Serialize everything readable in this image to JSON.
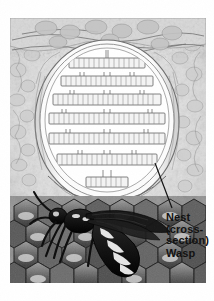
{
  "figure": {
    "style": "pencil / ink scientific illustration, grayscale halftone"
  },
  "labels": {
    "nest": {
      "name": "nest-label",
      "lines": [
        "Nest",
        "(cross-",
        "section)"
      ],
      "line1": "Nest",
      "line2": "(cross-",
      "line3": "section)",
      "x": 166,
      "y": 212,
      "leader_line": true
    },
    "wasp": {
      "name": "wasp-label",
      "lines": [
        "Wasp"
      ],
      "line1": "Wasp",
      "x": 166,
      "y": 248,
      "leader_line": false
    }
  },
  "leader_lines": [
    {
      "name": "nest-leader-line",
      "from_x": 155,
      "from_y": 163,
      "to_x": 172,
      "to_y": 208
    }
  ],
  "scene": {
    "background": {
      "name": "rock-wall-background",
      "description": "mottled rocky cavity wall surrounding the nest"
    },
    "ceiling": {
      "name": "nest-attachment-ceiling",
      "description": "rocky bark ceiling the nest hangs from"
    },
    "envelope": {
      "name": "nest-envelope",
      "description": "layered papery outer shell of the nest, shown cut open",
      "layers": 3
    },
    "combs": {
      "name": "comb-tiers",
      "description": "horizontal tiers of brood cells suspended by pedicels",
      "tier_count": 7,
      "tiers": [
        {
          "index": 1,
          "cy": 63,
          "half_width": 38,
          "cell_height": 9,
          "cells": 15
        },
        {
          "index": 2,
          "cy": 80,
          "half_width": 46,
          "cell_height": 9,
          "cells": 18
        },
        {
          "index": 3,
          "cy": 98,
          "half_width": 53,
          "cell_height": 10,
          "cells": 21
        },
        {
          "index": 4,
          "cy": 117,
          "half_width": 57,
          "cell_height": 10,
          "cells": 23
        },
        {
          "index": 5,
          "cy": 137,
          "half_width": 57,
          "cell_height": 10,
          "cells": 23
        },
        {
          "index": 6,
          "cy": 158,
          "half_width": 50,
          "cell_height": 10,
          "cells": 20
        },
        {
          "index": 7,
          "cy": 180,
          "half_width": 21,
          "cell_height": 9,
          "cells": 9
        }
      ]
    },
    "wasp": {
      "name": "wasp-illustration",
      "description": "adult wasp in profile standing on hexagonal comb",
      "parts": [
        "head",
        "antennae",
        "thorax",
        "wings",
        "abdomen",
        "legs",
        "stripes"
      ],
      "orientation": "head-left",
      "abdomen_bands": 5
    },
    "foreground_comb": {
      "name": "foreground-honeycomb",
      "description": "dark hexagonal comb cells in the foreground",
      "cell_shape": "hexagon"
    }
  },
  "colors": {
    "paper": "#ffffff",
    "ink_dark": "#121212",
    "line": "#4a4a4a",
    "rock_light": "#e8e8e8",
    "rock_mid": "#c6c6c6",
    "rock_dark": "#9a9a9a",
    "comb_fill": "#f2f2f2",
    "comb_line": "#6b6b6b",
    "wasp_body": "#151515",
    "wasp_band": "#f0f0f0",
    "hex_dark": "#4f4f4f",
    "hex_mid": "#7d7d7d",
    "hex_light": "#b5b5b5"
  }
}
